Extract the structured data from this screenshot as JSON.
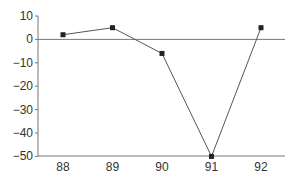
{
  "chart_data": {
    "type": "line",
    "title": "",
    "xlabel": "",
    "ylabel": "",
    "categories": [
      "88",
      "89",
      "90",
      "91",
      "92"
    ],
    "series": [
      {
        "name": "series-1",
        "values": [
          2,
          5,
          -6,
          -50,
          5
        ],
        "marker": "square"
      }
    ],
    "ylim": [
      -50,
      10
    ],
    "yticks": [
      "10",
      "0",
      "−10",
      "−20",
      "−30",
      "−40",
      "−50"
    ],
    "ytick_values": [
      10,
      0,
      -10,
      -20,
      -30,
      -40,
      -50
    ],
    "grid": false,
    "legend": "none",
    "reference_line_y": 0,
    "colors": {
      "line": "#555555",
      "marker": "#222222",
      "axis": "#777777",
      "text": "#333333"
    }
  }
}
